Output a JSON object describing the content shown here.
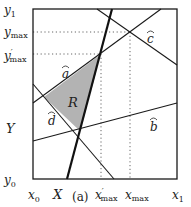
{
  "figure": {
    "caption": "(a)",
    "region_label": "R",
    "line_labels": {
      "a": "a",
      "b": "b",
      "c": "c",
      "d": "d"
    },
    "y_axis_labels": {
      "y1": "y",
      "y1_sub": "1",
      "ymax": "y",
      "ymax_sub": "max",
      "yprime_max": "y",
      "yprime_max_prime": "′",
      "yprime_max_sub": "max",
      "Y": "Y",
      "y0": "y",
      "y0_sub": "0"
    },
    "x_axis_labels": {
      "x0": "x",
      "x0_sub": "0",
      "X": "X",
      "xprime_max": "x",
      "xprime_max_prime": "′",
      "xprime_max_sub": "max",
      "xmax": "x",
      "xmax_sub": "max",
      "x1": "x",
      "x1_sub": "1"
    },
    "colors": {
      "line": "#1a1a1a",
      "region_fill": "#b3b3b3",
      "dotted": "#555555"
    }
  }
}
